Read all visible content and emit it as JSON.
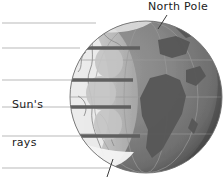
{
  "figure": {
    "type": "diagram",
    "background_color": "#ffffff"
  },
  "labels": {
    "north_pole": "North Pole",
    "sun_rays_line1": "Sun's",
    "sun_rays_line2": "rays"
  },
  "globe": {
    "name": "earth-globe",
    "center_x": 146,
    "center_y": 97,
    "radius": 76,
    "ocean_color": "#7d7d7d",
    "land_color": "#5f5f5f",
    "dark_limb_color": "#3a3a3a",
    "lit_color": "#cfcfcf",
    "terminator_color": "#bfbfbf",
    "ice_color": "#f2f2f2",
    "outline_color": "#9a9a9a"
  },
  "sun_rays": {
    "name": "sun-ray-lines",
    "color": "#b9b9b9",
    "beam_color": "#6a6a6a",
    "count": 6,
    "y_positions": [
      23,
      48,
      80,
      107,
      136,
      168
    ],
    "x_start": 2,
    "x_end": 150
  },
  "illumination_spots": {
    "name": "sunlight-footprints",
    "color": "#c6c6c6",
    "spots": [
      {
        "cx": 109,
        "cy": 62,
        "rx": 14,
        "ry": 16
      },
      {
        "cx": 101,
        "cy": 93,
        "rx": 15,
        "ry": 17
      },
      {
        "cx": 108,
        "cy": 124,
        "rx": 14,
        "ry": 16
      }
    ]
  },
  "pointers": {
    "north_pole_leader": {
      "name": "north-pole-leader-line",
      "x1": 167,
      "y1": 15,
      "x2": 159,
      "y2": 28
    },
    "south_pole_leader": {
      "name": "south-pole-leader-line",
      "x1": 113,
      "y1": 160,
      "x2": 108,
      "y2": 177
    }
  },
  "colors": {
    "text": "#1b1b1b",
    "ray_line": "#b9b9b9",
    "beam": "#6a6a6a"
  }
}
